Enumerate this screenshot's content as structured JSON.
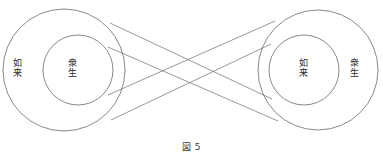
{
  "figure": {
    "caption": "図 5",
    "stroke_color": "#6b6b6b",
    "text_color": "#2b2b2b",
    "background_color": "#ffffff"
  },
  "left_group": {
    "outer_label": "如来",
    "inner_label": "衆生",
    "outer_circle": {
      "cx": 64,
      "cy": 70,
      "r": 61
    },
    "inner_circle": {
      "cx": 78,
      "cy": 70,
      "r": 35
    }
  },
  "right_group": {
    "outer_label": "衆生",
    "inner_label": "如来",
    "outer_circle": {
      "cx": 318,
      "cy": 70,
      "r": 60
    },
    "inner_circle": {
      "cx": 304,
      "cy": 70,
      "r": 35
    }
  },
  "connectors": [
    {
      "name": "left-outer-top-to-right-inner-bottom",
      "x1": 110,
      "y1": 23,
      "x2": 272,
      "y2": 99
    },
    {
      "name": "left-inner-top-to-right-outer-bottom",
      "x1": 108,
      "y1": 47,
      "x2": 278,
      "y2": 121
    },
    {
      "name": "left-inner-bottom-to-right-outer-top",
      "x1": 108,
      "y1": 95,
      "x2": 275,
      "y2": 21
    },
    {
      "name": "left-outer-bottom-to-right-inner-top",
      "x1": 111,
      "y1": 120,
      "x2": 271,
      "y2": 44
    }
  ]
}
